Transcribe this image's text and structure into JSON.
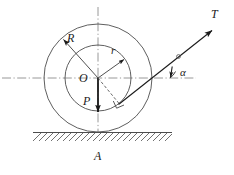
{
  "figure": {
    "background_color": "#ffffff",
    "stroke_color": "#4d4d4d",
    "ink_color": "#1a1a1a",
    "axis_color": "#8c8c8c",
    "width": 234,
    "height": 175
  },
  "labels": {
    "outer_radius": "R",
    "inner_radius": "r",
    "center": "O",
    "weight": "P",
    "tension": "T",
    "angle": "α",
    "contact_point": "A"
  },
  "geometry": {
    "center_x": 98,
    "center_y": 78,
    "outer_radius_px": 54,
    "inner_radius_px": 33,
    "ground_y": 132,
    "ground_left": 33,
    "ground_right": 172,
    "axis_h_left": 2,
    "axis_h_right": 196,
    "axis_v_top": 7,
    "axis_v_bottom": 133,
    "tension_angle_deg": 33,
    "tension_tip_x": 215,
    "tension_tip_y": 28,
    "weight_tip_x": 98,
    "weight_tip_y": 116,
    "r_arrow_tip_x": 125,
    "r_arrow_tip_y": 59,
    "R_arrow_tip_x": 62,
    "R_arrow_tip_y": 38
  },
  "elements": {
    "outer_circle": "outer-circle",
    "inner_circle": "inner-circle",
    "horizontal_axis": "horizontal-center-axis",
    "vertical_axis": "vertical-center-axis",
    "ground": "ground-hatching",
    "tension_vector": "tension-force-vector",
    "weight_vector": "weight-force-vector",
    "perpendicular_marker": "right-angle-marker",
    "moment_arm": "moment-arm-dashed-line"
  }
}
